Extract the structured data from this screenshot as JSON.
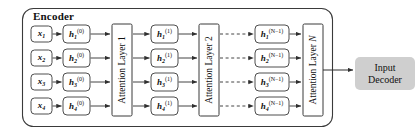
{
  "diagram": {
    "encoder": {
      "label": "Encoder"
    },
    "inputs": [
      {
        "sym": "x",
        "sub": "1",
        "sup": ""
      },
      {
        "sym": "x",
        "sub": "2",
        "sup": ""
      },
      {
        "sym": "x",
        "sub": "3",
        "sup": ""
      },
      {
        "sym": "x",
        "sub": "4",
        "sup": ""
      }
    ],
    "hidden_layer_0": [
      {
        "sym": "h",
        "sub": "1",
        "sup": "(0)"
      },
      {
        "sym": "h",
        "sub": "2",
        "sup": "(0)"
      },
      {
        "sym": "h",
        "sub": "3",
        "sup": "(0)"
      },
      {
        "sym": "h",
        "sub": "4",
        "sup": "(0)"
      }
    ],
    "hidden_layer_1": [
      {
        "sym": "h",
        "sub": "1",
        "sup": "(1)"
      },
      {
        "sym": "h",
        "sub": "2",
        "sup": "(1)"
      },
      {
        "sym": "h",
        "sub": "3",
        "sup": "(1)"
      },
      {
        "sym": "h",
        "sub": "4",
        "sup": "(1)"
      }
    ],
    "hidden_layer_nm1": [
      {
        "sym": "h",
        "sub": "1",
        "sup": "(N−1)"
      },
      {
        "sym": "h",
        "sub": "2",
        "sup": "(N−1)"
      },
      {
        "sym": "h",
        "sub": "3",
        "sup": "(N−1)"
      },
      {
        "sym": "h",
        "sub": "4",
        "sup": "(N−1)"
      }
    ],
    "attention_layers": [
      {
        "prefix": "Attention Layer ",
        "index": "1",
        "italic_index": false
      },
      {
        "prefix": "Attention Layer ",
        "index": "2",
        "italic_index": false
      },
      {
        "prefix": "Attention Layer ",
        "index": "N",
        "italic_index": true
      }
    ],
    "decoder": {
      "line1": "Input",
      "line2": "Decoder"
    },
    "colors": {
      "stroke": "#3a3a3a",
      "node_fill": "#ffffff",
      "decoder_fill": "#cfcfcf",
      "background": "#ffffff",
      "text": "#111111"
    },
    "edge_styles": {
      "solid": "solid",
      "skipped": "dashed"
    }
  }
}
